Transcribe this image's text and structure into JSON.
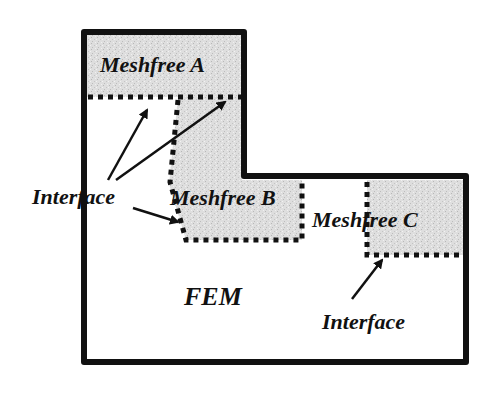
{
  "diagram": {
    "regions": {
      "meshfree_a": "Meshfree A",
      "meshfree_b": "Meshfree B",
      "meshfree_c": "Meshfree C",
      "fem": "FEM"
    },
    "annotations": {
      "interface_left": "Interface",
      "interface_right": "Interface"
    },
    "colors": {
      "outline": "#111111",
      "meshfree_fill": "#dcdcdc",
      "background": "#ffffff"
    }
  }
}
